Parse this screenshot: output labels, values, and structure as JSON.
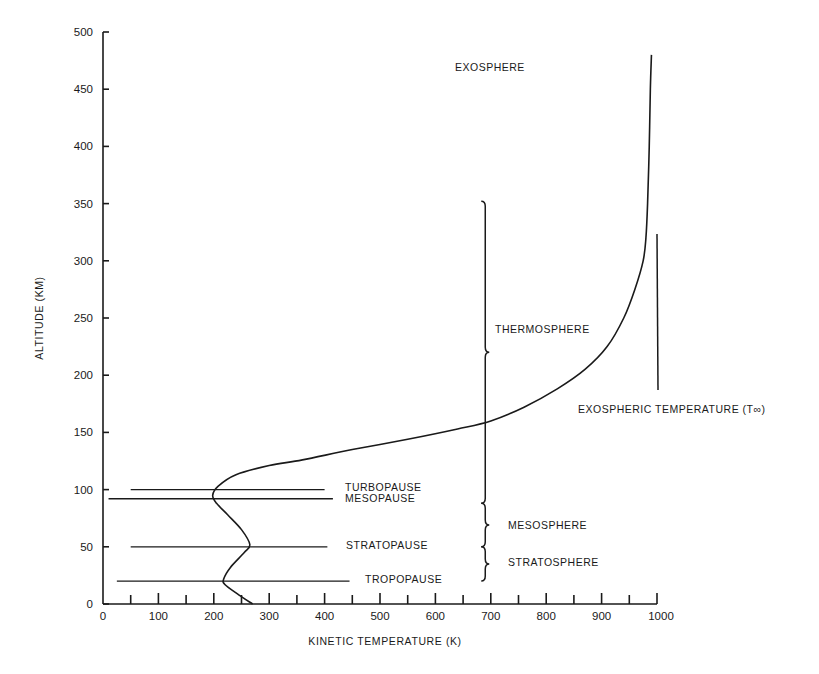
{
  "chart_data": {
    "type": "line",
    "title": "",
    "xlabel": "KINETIC TEMPERATURE (K)",
    "ylabel": "ALTITUDE (KM)",
    "xlim": [
      0,
      1000
    ],
    "ylim": [
      0,
      500
    ],
    "grid": false,
    "x_ticks": [
      0,
      100,
      200,
      300,
      400,
      500,
      600,
      700,
      800,
      900,
      1000
    ],
    "x_minor_ticks": [
      50,
      150,
      250,
      350,
      450,
      550,
      650,
      750,
      850,
      950
    ],
    "y_ticks": [
      0,
      50,
      100,
      150,
      200,
      250,
      300,
      350,
      400,
      450,
      500
    ],
    "series": [
      {
        "name": "Kinetic temperature profile",
        "points": [
          [
            270,
            0
          ],
          [
            245,
            8
          ],
          [
            220,
            17
          ],
          [
            218,
            22
          ],
          [
            230,
            32
          ],
          [
            255,
            45
          ],
          [
            265,
            52
          ],
          [
            250,
            65
          ],
          [
            225,
            78
          ],
          [
            205,
            88
          ],
          [
            198,
            95
          ],
          [
            208,
            103
          ],
          [
            240,
            113
          ],
          [
            300,
            121
          ],
          [
            360,
            126
          ],
          [
            450,
            135
          ],
          [
            550,
            144
          ],
          [
            640,
            153
          ],
          [
            700,
            160
          ],
          [
            760,
            172
          ],
          [
            820,
            188
          ],
          [
            870,
            205
          ],
          [
            910,
            225
          ],
          [
            940,
            250
          ],
          [
            960,
            275
          ],
          [
            975,
            300
          ],
          [
            980,
            320
          ],
          [
            983,
            350
          ],
          [
            986,
            400
          ],
          [
            988,
            450
          ],
          [
            990,
            480
          ]
        ]
      }
    ],
    "reference_lines": [
      {
        "label": "TURBOPAUSE",
        "altitude": 100,
        "x_start": 50,
        "x_end": 400
      },
      {
        "label": "MESOPAUSE",
        "altitude": 92,
        "x_start": 10,
        "x_end": 415
      },
      {
        "label": "STRATOPAUSE",
        "altitude": 50,
        "x_start": 50,
        "x_end": 405
      },
      {
        "label": "TROPOPAUSE",
        "altitude": 20,
        "x_start": 25,
        "x_end": 445
      }
    ],
    "regions": [
      {
        "label": "EXOSPHERE",
        "label_x": 640,
        "label_y": 467
      },
      {
        "label": "THERMOSPHERE",
        "label_x": 710,
        "label_y": 240,
        "brace_from": 88,
        "brace_to": 352
      },
      {
        "label": "MESOSPHERE",
        "label_x": 730,
        "label_y": 69,
        "brace_from": 50,
        "brace_to": 88
      },
      {
        "label": "STRATOSPHERE",
        "label_x": 730,
        "label_y": 33,
        "brace_from": 20,
        "brace_to": 50
      }
    ],
    "annotations": [
      {
        "text": "EXOSPHERIC TEMPERATURE (T∞)",
        "x": 850,
        "y": 168,
        "marker_line": {
          "x": 1003,
          "y_from": 187,
          "y_to": 323
        }
      }
    ]
  }
}
